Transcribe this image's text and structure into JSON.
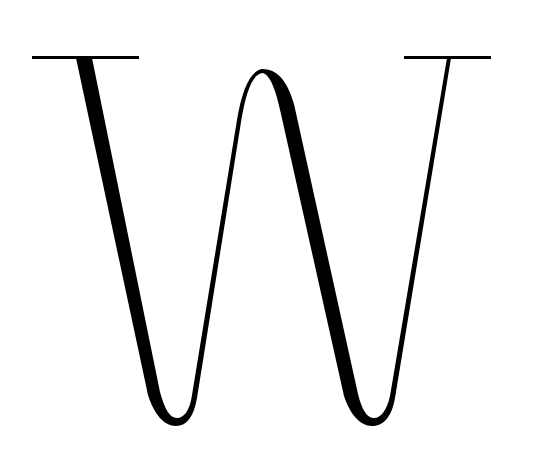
{
  "glyph": {
    "character": "W",
    "description": "Stylized high-contrast serif letter W",
    "foreground": "#000000",
    "background": "#ffffff"
  }
}
